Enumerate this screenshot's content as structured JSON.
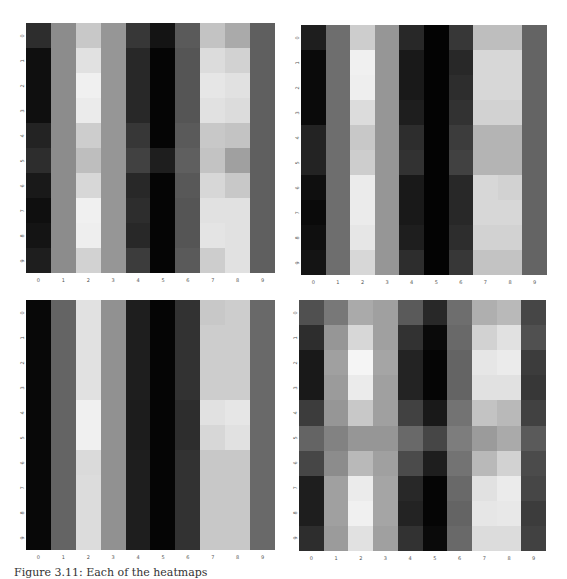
{
  "figure": {
    "caption": "Figure 3.11: Each of the heatmaps"
  },
  "chart_data": [
    {
      "type": "heatmap",
      "title": "",
      "position": "top-left",
      "colormap": "gray",
      "xlabel": "",
      "ylabel": "",
      "x_ticks": [
        "0",
        "1",
        "2",
        "3",
        "4",
        "5",
        "6",
        "7",
        "8",
        "9"
      ],
      "y_ticks": [
        "0",
        "1",
        "2",
        "3",
        "4",
        "5",
        "6",
        "7",
        "8",
        "9"
      ],
      "values": [
        [
          45,
          140,
          200,
          150,
          55,
          20,
          90,
          195,
          170,
          95
        ],
        [
          15,
          140,
          225,
          150,
          40,
          5,
          85,
          220,
          210,
          95
        ],
        [
          15,
          140,
          240,
          150,
          40,
          5,
          85,
          230,
          225,
          95
        ],
        [
          15,
          140,
          235,
          150,
          40,
          5,
          85,
          225,
          220,
          95
        ],
        [
          35,
          140,
          205,
          150,
          55,
          5,
          90,
          200,
          195,
          95
        ],
        [
          45,
          140,
          190,
          150,
          65,
          30,
          95,
          195,
          160,
          95
        ],
        [
          25,
          140,
          215,
          150,
          40,
          5,
          88,
          215,
          200,
          95
        ],
        [
          15,
          140,
          240,
          150,
          45,
          5,
          85,
          225,
          225,
          95
        ],
        [
          20,
          140,
          238,
          150,
          40,
          5,
          85,
          228,
          225,
          95
        ],
        [
          30,
          140,
          210,
          150,
          60,
          5,
          90,
          205,
          225,
          95
        ]
      ]
    },
    {
      "type": "heatmap",
      "title": "",
      "position": "top-right",
      "colormap": "gray",
      "xlabel": "",
      "ylabel": "",
      "x_ticks": [
        "0",
        "1",
        "2",
        "3",
        "4",
        "5",
        "6",
        "7",
        "8",
        "9"
      ],
      "y_ticks": [
        "0",
        "1",
        "2",
        "3",
        "4",
        "5",
        "6",
        "7",
        "8",
        "9"
      ],
      "values": [
        [
          30,
          110,
          205,
          150,
          40,
          3,
          55,
          190,
          190,
          100
        ],
        [
          10,
          110,
          240,
          150,
          25,
          3,
          40,
          215,
          215,
          100
        ],
        [
          10,
          110,
          238,
          150,
          25,
          3,
          45,
          215,
          215,
          100
        ],
        [
          10,
          110,
          220,
          150,
          30,
          3,
          50,
          210,
          210,
          100
        ],
        [
          35,
          110,
          200,
          150,
          45,
          3,
          60,
          180,
          180,
          100
        ],
        [
          35,
          110,
          205,
          150,
          50,
          3,
          65,
          180,
          180,
          100
        ],
        [
          15,
          110,
          235,
          150,
          25,
          3,
          40,
          215,
          210,
          100
        ],
        [
          10,
          110,
          235,
          150,
          25,
          3,
          40,
          215,
          215,
          100
        ],
        [
          15,
          110,
          230,
          150,
          30,
          3,
          45,
          210,
          210,
          100
        ],
        [
          20,
          110,
          215,
          150,
          45,
          3,
          55,
          195,
          195,
          100
        ]
      ]
    },
    {
      "type": "heatmap",
      "title": "",
      "position": "bottom-left",
      "colormap": "gray",
      "xlabel": "",
      "ylabel": "",
      "x_ticks": [
        "0",
        "1",
        "2",
        "3",
        "4",
        "5",
        "6",
        "7",
        "8",
        "9"
      ],
      "y_ticks": [
        "0",
        "1",
        "2",
        "3",
        "4",
        "5",
        "6",
        "7",
        "8",
        "9"
      ],
      "values": [
        [
          8,
          100,
          225,
          145,
          30,
          5,
          50,
          200,
          205,
          105
        ],
        [
          8,
          100,
          225,
          145,
          30,
          5,
          50,
          205,
          205,
          105
        ],
        [
          8,
          100,
          225,
          145,
          30,
          5,
          50,
          205,
          205,
          105
        ],
        [
          8,
          100,
          225,
          145,
          30,
          5,
          50,
          205,
          205,
          105
        ],
        [
          8,
          100,
          240,
          145,
          28,
          5,
          45,
          225,
          230,
          105
        ],
        [
          8,
          100,
          240,
          145,
          28,
          5,
          45,
          215,
          225,
          105
        ],
        [
          8,
          100,
          218,
          145,
          30,
          5,
          50,
          200,
          200,
          105
        ],
        [
          8,
          100,
          220,
          145,
          30,
          5,
          50,
          200,
          200,
          105
        ],
        [
          8,
          100,
          220,
          145,
          30,
          5,
          50,
          200,
          200,
          105
        ],
        [
          8,
          100,
          220,
          145,
          30,
          5,
          50,
          200,
          200,
          105
        ]
      ]
    },
    {
      "type": "heatmap",
      "title": "",
      "position": "bottom-right",
      "colormap": "gray",
      "xlabel": "",
      "ylabel": "",
      "x_ticks": [
        "0",
        "1",
        "2",
        "3",
        "4",
        "5",
        "6",
        "7",
        "8",
        "9"
      ],
      "y_ticks": [
        "0",
        "1",
        "2",
        "3",
        "4",
        "5",
        "6",
        "7",
        "8",
        "9"
      ],
      "values": [
        [
          80,
          120,
          170,
          160,
          90,
          40,
          110,
          175,
          185,
          70
        ],
        [
          45,
          150,
          215,
          160,
          50,
          10,
          105,
          210,
          225,
          80
        ],
        [
          25,
          160,
          245,
          165,
          35,
          5,
          100,
          230,
          235,
          60
        ],
        [
          25,
          155,
          235,
          160,
          35,
          5,
          100,
          225,
          225,
          55
        ],
        [
          60,
          150,
          200,
          160,
          65,
          25,
          115,
          195,
          185,
          65
        ],
        [
          100,
          130,
          150,
          150,
          105,
          70,
          125,
          155,
          170,
          90
        ],
        [
          70,
          140,
          185,
          160,
          75,
          30,
          115,
          185,
          210,
          75
        ],
        [
          30,
          160,
          235,
          165,
          40,
          5,
          105,
          225,
          235,
          70
        ],
        [
          30,
          160,
          240,
          165,
          35,
          5,
          100,
          230,
          232,
          60
        ],
        [
          45,
          155,
          225,
          160,
          50,
          10,
          105,
          220,
          220,
          65
        ]
      ]
    }
  ],
  "layout": {
    "panels": [
      {
        "left": 26,
        "top": 23,
        "width": 249,
        "height": 250
      },
      {
        "left": 301,
        "top": 25,
        "width": 246,
        "height": 250
      },
      {
        "left": 26,
        "top": 300,
        "width": 249,
        "height": 250
      },
      {
        "left": 299,
        "top": 300,
        "width": 247,
        "height": 251
      }
    ]
  }
}
